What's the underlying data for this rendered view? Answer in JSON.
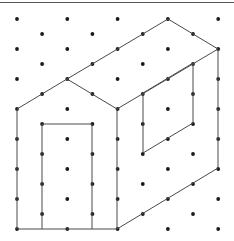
{
  "diagram": {
    "type": "isometric-dot-grid-drawing",
    "colors": {
      "background": "#ffffff",
      "dot": "#1a1a1a",
      "line": "#4a4a4a",
      "border": "#555555"
    },
    "grid": {
      "x0": 17,
      "dx": 25.15,
      "columns": 9,
      "even_column_y_start": 19,
      "odd_column_y_start": 34,
      "dy": 30,
      "y_max": 235
    },
    "edges": [
      {
        "name": "front-left-wall",
        "points": [
          [
            17,
            109
          ],
          [
            17,
            229
          ]
        ]
      },
      {
        "name": "front-bottom",
        "points": [
          [
            17,
            229
          ],
          [
            117,
            229
          ]
        ]
      },
      {
        "name": "front-right-wall",
        "points": [
          [
            117,
            109
          ],
          [
            117,
            229
          ]
        ]
      },
      {
        "name": "front-gable-left",
        "points": [
          [
            17,
            109
          ],
          [
            67,
            79
          ]
        ]
      },
      {
        "name": "front-gable-right",
        "points": [
          [
            67,
            79
          ],
          [
            117,
            109
          ]
        ]
      },
      {
        "name": "roof-ridge",
        "points": [
          [
            67,
            79
          ],
          [
            168,
            19
          ]
        ]
      },
      {
        "name": "roof-back-eave",
        "points": [
          [
            168,
            19
          ],
          [
            218,
            49
          ]
        ]
      },
      {
        "name": "roof-front-eave",
        "points": [
          [
            117,
            109
          ],
          [
            218,
            49
          ]
        ]
      },
      {
        "name": "side-back-wall",
        "points": [
          [
            218,
            49
          ],
          [
            218,
            168
          ]
        ]
      },
      {
        "name": "side-bottom",
        "points": [
          [
            117,
            229
          ],
          [
            218,
            168
          ]
        ]
      },
      {
        "name": "door",
        "points": [
          [
            42,
            229
          ],
          [
            42,
            124
          ],
          [
            92,
            124
          ],
          [
            92,
            229
          ]
        ]
      },
      {
        "name": "side-window",
        "points": [
          [
            143,
            93
          ],
          [
            193,
            63
          ],
          [
            193,
            123
          ],
          [
            143,
            153
          ],
          [
            143,
            93
          ]
        ]
      }
    ]
  }
}
